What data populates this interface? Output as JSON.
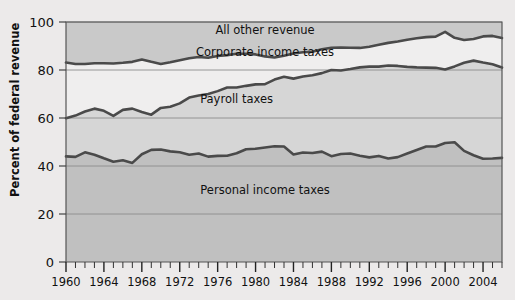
{
  "chart_data": {
    "type": "area",
    "title": "",
    "xlabel": "",
    "ylabel": "Percent of federal revenue",
    "ylim": [
      0,
      100
    ],
    "xlim": [
      1960,
      2006
    ],
    "yticks": [
      0,
      20,
      40,
      60,
      80,
      100
    ],
    "ytick_labels": [
      "0",
      "20",
      "40",
      "60",
      "80",
      "100"
    ],
    "xtick_labels": [
      "1960",
      "1964",
      "1968",
      "1972",
      "1976",
      "1980",
      "1984",
      "1988",
      "1992",
      "1996",
      "2000",
      "2004"
    ],
    "xticks": [
      1960,
      1964,
      1968,
      1972,
      1976,
      1980,
      1984,
      1988,
      1992,
      1996,
      2000,
      2004
    ],
    "minor_tick_interval": 1,
    "grid": true,
    "stacked": true,
    "legend_position": "inline-annotations",
    "annotations": [
      {
        "text": "All other revenue",
        "x": 1981,
        "y": 96.5
      },
      {
        "text": "Corporate income taxes",
        "x": 1981,
        "y": 87.5
      },
      {
        "text": "Payroll taxes",
        "x": 1978,
        "y": 68.0
      },
      {
        "text": "Personal income taxes",
        "x": 1981,
        "y": 30.0
      }
    ],
    "x": [
      1960,
      1961,
      1962,
      1963,
      1964,
      1965,
      1966,
      1967,
      1968,
      1969,
      1970,
      1971,
      1972,
      1973,
      1974,
      1975,
      1976,
      1977,
      1978,
      1979,
      1980,
      1981,
      1982,
      1983,
      1984,
      1985,
      1986,
      1987,
      1988,
      1989,
      1990,
      1991,
      1992,
      1993,
      1994,
      1995,
      1996,
      1997,
      1998,
      1999,
      2000,
      2001,
      2002,
      2003,
      2004,
      2005,
      2006
    ],
    "series": [
      {
        "name": "Personal income taxes",
        "boundary_name": "personal-top",
        "values": [
          44.0,
          43.8,
          45.7,
          44.7,
          43.2,
          41.8,
          42.4,
          41.3,
          44.9,
          46.7,
          46.9,
          46.1,
          45.7,
          44.7,
          45.2,
          43.9,
          44.2,
          44.3,
          45.3,
          47.0,
          47.2,
          47.7,
          48.2,
          48.1,
          44.8,
          45.6,
          45.4,
          46.0,
          44.1,
          45.0,
          45.2,
          44.3,
          43.6,
          44.2,
          43.1,
          43.7,
          45.2,
          46.7,
          48.1,
          48.1,
          49.6,
          49.9,
          46.3,
          44.5,
          43.0,
          43.1,
          43.4
        ],
        "area_name": "personal-income-taxes-band",
        "fill": "#c0c0c0"
      },
      {
        "name": "Payroll taxes",
        "boundary_name": "payroll-top",
        "values": [
          59.9,
          61.0,
          62.7,
          63.9,
          63.0,
          60.9,
          63.4,
          63.9,
          62.5,
          61.4,
          64.2,
          64.7,
          66.1,
          68.5,
          69.4,
          70.0,
          71.2,
          72.7,
          72.7,
          73.4,
          74.0,
          74.1,
          76.0,
          77.2,
          76.4,
          77.3,
          77.8,
          78.7,
          80.0,
          79.8,
          80.4,
          81.1,
          81.4,
          81.4,
          81.9,
          81.7,
          81.3,
          81.1,
          81.0,
          80.9,
          80.2,
          81.5,
          83.0,
          83.9,
          83.1,
          82.4,
          81.0
        ],
        "area_name": "payroll-taxes-band",
        "fill": "#d6d6d6"
      },
      {
        "name": "Corporate income taxes",
        "boundary_name": "corporate-top",
        "values": [
          83.1,
          82.5,
          82.5,
          82.8,
          82.8,
          82.7,
          83.0,
          83.4,
          84.4,
          83.4,
          82.5,
          83.2,
          84.1,
          84.9,
          85.4,
          85.1,
          85.8,
          86.2,
          86.8,
          86.8,
          86.5,
          85.6,
          85.2,
          85.9,
          86.9,
          87.4,
          87.6,
          88.6,
          89.3,
          89.4,
          89.3,
          89.2,
          89.7,
          90.5,
          91.3,
          91.9,
          92.6,
          93.2,
          93.7,
          93.9,
          95.9,
          93.4,
          92.5,
          92.9,
          94.0,
          94.2,
          93.3
        ],
        "area_name": "corporate-income-taxes-band",
        "fill": "#efeeee"
      },
      {
        "name": "All other revenue",
        "boundary_name": "chart-top",
        "values": [
          100,
          100,
          100,
          100,
          100,
          100,
          100,
          100,
          100,
          100,
          100,
          100,
          100,
          100,
          100,
          100,
          100,
          100,
          100,
          100,
          100,
          100,
          100,
          100,
          100,
          100,
          100,
          100,
          100,
          100,
          100,
          100,
          100,
          100,
          100,
          100,
          100,
          100,
          100,
          100,
          100,
          100,
          100,
          100,
          100,
          100,
          100
        ],
        "area_name": "all-other-revenue-band",
        "fill": "#c9c9c9"
      }
    ],
    "colors": {
      "line": "#4a4a4a",
      "background": "#eceaea",
      "personal_band": "#c0c0c0",
      "payroll_band": "#d6d6d6",
      "corporate_band": "#efeeee",
      "other_band": "#c9c9c9",
      "gridline": "#8d8d8d",
      "axis": "#555555",
      "text": "#111111"
    }
  }
}
